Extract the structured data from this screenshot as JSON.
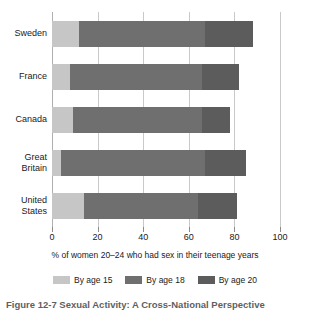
{
  "chart_data": {
    "type": "bar",
    "orientation": "horizontal",
    "stacked": true,
    "title": "",
    "xlabel": "% of women 20–24 who had sex in their teenage years",
    "ylabel": "",
    "xlim": [
      0,
      100
    ],
    "xticks": [
      0,
      20,
      40,
      60,
      80,
      100
    ],
    "grid": true,
    "legend_position": "bottom",
    "categories": [
      "Sweden",
      "France",
      "Canada",
      "Great Britain",
      "United States"
    ],
    "series": [
      {
        "name": "By age 15",
        "color": "#c6c6c6",
        "values": [
          12,
          8,
          9,
          4,
          14
        ]
      },
      {
        "name": "By age 18",
        "color": "#6f6f6f",
        "values": [
          55,
          58,
          57,
          63,
          50
        ]
      },
      {
        "name": "By age 20",
        "color": "#5c5c5c",
        "values": [
          21,
          16,
          12,
          18,
          17
        ]
      }
    ],
    "cumulative_totals": [
      88,
      82,
      78,
      85,
      81
    ]
  },
  "axis": {
    "x_title": "% of women 20–24 who had sex in their teenage years",
    "tick_labels": [
      "0",
      "20",
      "40",
      "60",
      "80",
      "100"
    ],
    "category_labels": [
      "Sweden",
      "France",
      "Canada",
      "Great\nBritain",
      "United\nStates"
    ]
  },
  "legend": {
    "items": [
      {
        "label": "By age 15",
        "color": "#c6c6c6"
      },
      {
        "label": "By age 18",
        "color": "#6f6f6f"
      },
      {
        "label": "By age 20",
        "color": "#5c5c5c"
      }
    ]
  },
  "caption": {
    "text": "Figure 12-7  Sexual Activity: A Cross-National Perspective"
  }
}
